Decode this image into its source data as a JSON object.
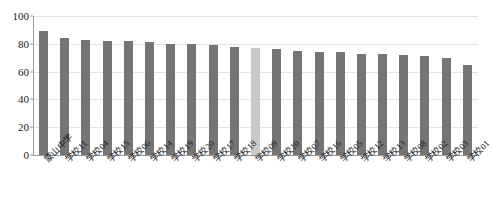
{
  "chart_data": {
    "type": "bar",
    "title": "",
    "xlabel": "",
    "ylabel": "",
    "ylim": [
      0,
      100
    ],
    "yticks": [
      0,
      20,
      40,
      60,
      80,
      100
    ],
    "grid": true,
    "legend": false,
    "bar_color": "#757575",
    "highlight_color": "#c9c9c9",
    "highlight_index": 10,
    "categories": [
      "蒙山中学",
      "学校11",
      "学校04",
      "学校15",
      "学校06",
      "学校14",
      "学校19",
      "学校20",
      "学校17",
      "学校18",
      "学校09",
      "学校10",
      "学校07",
      "学校16",
      "学校05",
      "学校12",
      "学校13",
      "学校08",
      "学校02",
      "学校03",
      "学校01"
    ],
    "values": [
      89,
      84,
      83,
      82,
      82,
      81,
      80,
      80,
      79,
      78,
      77,
      76,
      75,
      74,
      74,
      73,
      73,
      72,
      71,
      70,
      65
    ]
  }
}
